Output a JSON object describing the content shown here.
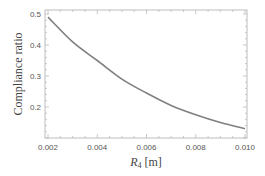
{
  "chart_data": {
    "type": "line",
    "title": "",
    "xlabel": "R4 [m]",
    "xlabel_main": "R",
    "xlabel_sub": "4",
    "xlabel_unit": " [m]",
    "ylabel": "Compliance ratio",
    "xlim": [
      0.002,
      0.01
    ],
    "ylim": [
      0.1,
      0.5
    ],
    "x_ticks": [
      "0.002",
      "0.004",
      "0.006",
      "0.008",
      "0.010"
    ],
    "y_ticks": [
      "0.2",
      "0.3",
      "0.4",
      "0.5"
    ],
    "grid": false,
    "legend": null,
    "series": [
      {
        "name": "Compliance ratio",
        "color": "#808080",
        "x": [
          0.002,
          0.003,
          0.004,
          0.005,
          0.006,
          0.007,
          0.008,
          0.009,
          0.01
        ],
        "values": [
          0.49,
          0.41,
          0.35,
          0.29,
          0.245,
          0.205,
          0.175,
          0.15,
          0.13
        ]
      }
    ]
  }
}
